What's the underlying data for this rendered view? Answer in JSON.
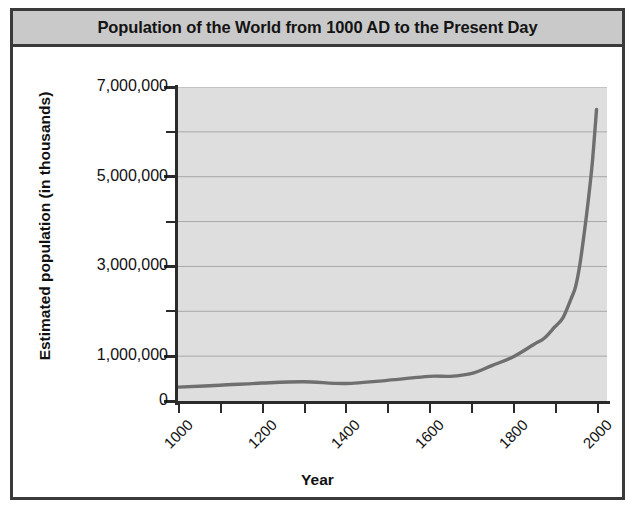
{
  "chart_data": {
    "type": "line",
    "title": "Population of the World from 1000 AD to the Present Day",
    "xlabel": "Year",
    "ylabel": "Estimated population (in thousands)",
    "xlim": [
      1000,
      2025
    ],
    "ylim": [
      0,
      7000000
    ],
    "grid": true,
    "legend": "none",
    "line_color": "#6f6f6f",
    "plot_background": "#dedede",
    "x_tick_labels": [
      "1000",
      "1200",
      "1400",
      "1600",
      "1800",
      "2000"
    ],
    "x_tick_values": [
      1000,
      1200,
      1400,
      1600,
      1800,
      2000
    ],
    "x_minor_tick_values": [
      1000,
      1100,
      1200,
      1300,
      1400,
      1500,
      1600,
      1700,
      1800,
      1900,
      2000
    ],
    "y_tick_labels": [
      "0",
      "1,000,000",
      "3,000,000",
      "5,000,000",
      "7,000,000"
    ],
    "y_tick_values": [
      0,
      1000000,
      3000000,
      5000000,
      7000000
    ],
    "y_minor_tick_values": [
      2000000,
      4000000,
      6000000
    ],
    "y_gridline_values": [
      1000000,
      2000000,
      3000000,
      4000000,
      5000000,
      6000000,
      7000000
    ],
    "series": [
      {
        "name": "World population",
        "x": [
          1000,
          1100,
          1200,
          1300,
          1400,
          1500,
          1600,
          1650,
          1700,
          1750,
          1800,
          1850,
          1875,
          1900,
          1920,
          1940,
          1950,
          1960,
          1970,
          1980,
          1990,
          2000
        ],
        "values": [
          310000,
          350000,
          400000,
          430000,
          390000,
          460000,
          550000,
          550000,
          610000,
          790000,
          980000,
          1260000,
          1400000,
          1650000,
          1860000,
          2300000,
          2550000,
          3030000,
          3700000,
          4450000,
          5320000,
          6500000
        ]
      }
    ]
  },
  "figure": {
    "frame_color": "#3a3a3a",
    "title_bar_color": "#c9c9c9"
  }
}
